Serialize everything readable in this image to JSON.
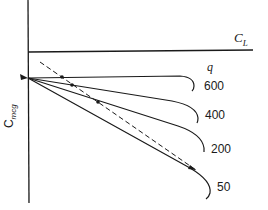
{
  "diagram": {
    "axes": {
      "x_label_main": "C",
      "x_label_sub": "L",
      "y_label_main": "C",
      "y_label_sub": "mcg"
    },
    "parameter_label": "q",
    "curves": [
      {
        "label": "600",
        "value": 600
      },
      {
        "label": "400",
        "value": 400
      },
      {
        "label": "200",
        "value": 200
      },
      {
        "label": "50",
        "value": 50
      }
    ],
    "dashed_line": "neutral point locus",
    "colors": {
      "ink": "#1a1a1a",
      "background": "#ffffff"
    }
  }
}
